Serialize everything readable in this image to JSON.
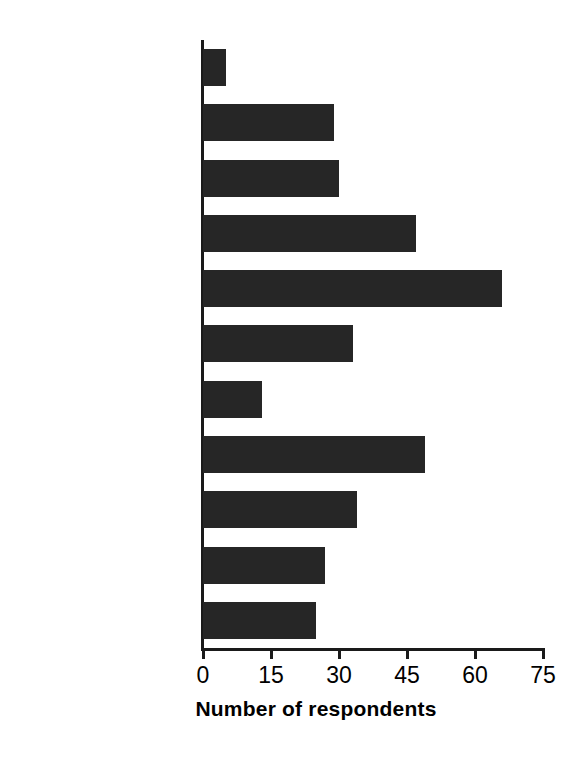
{
  "chart_data": {
    "type": "bar",
    "orientation": "horizontal",
    "title": "",
    "subtitle": "",
    "xlabel": "Number of respondents",
    "ylabel": "",
    "categories": [
      "Others (Scotland\n& Wales)",
      "Yorkshire and\nHumberside",
      "West Midlands",
      "South West",
      "South East",
      "North West",
      "North East",
      "London",
      "East Midlands",
      "East of England",
      "All regions"
    ],
    "values": [
      5,
      29,
      30,
      47,
      66,
      33,
      13,
      49,
      34,
      27,
      25
    ],
    "xlim": [
      0,
      75
    ],
    "xticks": [
      0,
      15,
      30,
      45,
      60,
      75
    ],
    "xtick_labels": [
      "0",
      "15",
      "30",
      "45",
      "60",
      "75"
    ],
    "grid": false,
    "legend": false,
    "bar_color": "#262626",
    "axis_color": "#1a1a1a",
    "background_color": "#ffffff"
  }
}
